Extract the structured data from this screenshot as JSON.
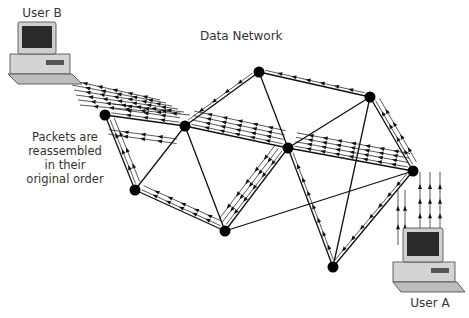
{
  "title": "Data Network",
  "labels": {
    "user_b": "User B",
    "user_a": "User A",
    "note_lines": [
      "Packets are",
      "reassembled",
      "in their",
      "original order"
    ]
  },
  "nodes": [
    {
      "id": "n1",
      "x": 105,
      "y": 115
    },
    {
      "id": "n2",
      "x": 185,
      "y": 126
    },
    {
      "id": "n3",
      "x": 135,
      "y": 190
    },
    {
      "id": "n4",
      "x": 225,
      "y": 231
    },
    {
      "id": "n5",
      "x": 288,
      "y": 148
    },
    {
      "id": "n6",
      "x": 259,
      "y": 72
    },
    {
      "id": "n7",
      "x": 370,
      "y": 97
    },
    {
      "id": "n8",
      "x": 413,
      "y": 171
    },
    {
      "id": "n9",
      "x": 333,
      "y": 267
    }
  ],
  "links": [
    [
      "n1",
      "n2"
    ],
    [
      "n1",
      "n3"
    ],
    [
      "n2",
      "n3"
    ],
    [
      "n2",
      "n6"
    ],
    [
      "n2",
      "n5"
    ],
    [
      "n2",
      "n4"
    ],
    [
      "n3",
      "n4"
    ],
    [
      "n4",
      "n5"
    ],
    [
      "n5",
      "n6"
    ],
    [
      "n6",
      "n7"
    ],
    [
      "n5",
      "n7"
    ],
    [
      "n5",
      "n8"
    ],
    [
      "n5",
      "n9"
    ],
    [
      "n7",
      "n8"
    ],
    [
      "n7",
      "n9"
    ],
    [
      "n8",
      "n9"
    ],
    [
      "n4",
      "n8"
    ]
  ],
  "packet_paths": [
    {
      "from": "n8",
      "to": "n5",
      "lanes": 4
    },
    {
      "from": "n5",
      "to": "n2",
      "lanes": 4
    },
    {
      "from": "n2",
      "to": "n1",
      "lanes": 3
    },
    {
      "from": "n8",
      "to": "n7",
      "lanes": 2
    },
    {
      "from": "n7",
      "to": "n6",
      "lanes": 1
    },
    {
      "from": "n6",
      "to": "n2",
      "lanes": 1
    },
    {
      "from": "n8",
      "to": "n9",
      "lanes": 1
    },
    {
      "from": "n9",
      "to": "n5",
      "lanes": 1
    },
    {
      "from": "n5",
      "to": "n4",
      "lanes": 3
    },
    {
      "from": "n4",
      "to": "n3",
      "lanes": 2
    },
    {
      "from": "n3",
      "to": "n1",
      "lanes": 2
    },
    {
      "from": "n2",
      "to": "n1",
      "lanes": 2,
      "offset": -14
    }
  ],
  "colors": {
    "line": "#111111",
    "node": "#000000",
    "text": "#333333",
    "computer": "#d9d9d9",
    "screen": "#2a2a2a"
  }
}
